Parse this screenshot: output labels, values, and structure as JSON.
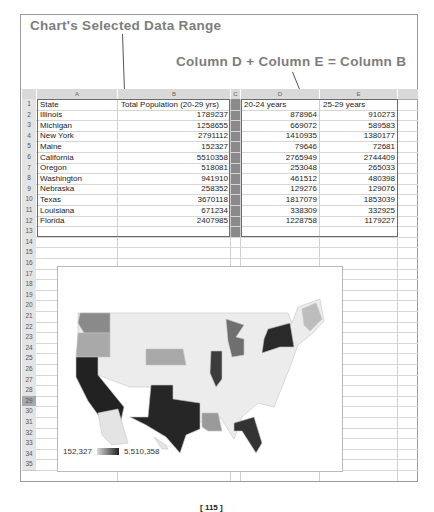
{
  "annotations": {
    "selected_range_label": "Chart's Selected Data Range",
    "formula_label": "Column D + Column E = Column B"
  },
  "spreadsheet": {
    "columns": [
      "A",
      "B",
      "C",
      "D",
      "E"
    ],
    "row_numbers": [
      "1",
      "2",
      "3",
      "4",
      "5",
      "6",
      "7",
      "8",
      "9",
      "10",
      "11",
      "12",
      "13",
      "14",
      "15",
      "16",
      "17",
      "18",
      "19",
      "20",
      "21",
      "22",
      "23",
      "24",
      "25",
      "26",
      "27",
      "28",
      "29",
      "30",
      "31",
      "32",
      "33",
      "34",
      "35"
    ],
    "selected_row": "29",
    "headers": {
      "state": "State",
      "total": "Total Population (20-29 yrs)",
      "age_20_24": "20-24 years",
      "age_25_29": "25-29 years"
    },
    "rows": [
      {
        "state": "Illinois",
        "total": "1789237",
        "age_20_24": "878964",
        "age_25_29": "910273"
      },
      {
        "state": "Michigan",
        "total": "1258655",
        "age_20_24": "669072",
        "age_25_29": "589583"
      },
      {
        "state": "New York",
        "total": "2791112",
        "age_20_24": "1410935",
        "age_25_29": "1380177"
      },
      {
        "state": "Maine",
        "total": "152327",
        "age_20_24": "79646",
        "age_25_29": "72681"
      },
      {
        "state": "California",
        "total": "5510358",
        "age_20_24": "2765949",
        "age_25_29": "2744409"
      },
      {
        "state": "Oregon",
        "total": "518081",
        "age_20_24": "253048",
        "age_25_29": "265033"
      },
      {
        "state": "Washington",
        "total": "941910",
        "age_20_24": "461512",
        "age_25_29": "480398"
      },
      {
        "state": "Nebraska",
        "total": "258352",
        "age_20_24": "129276",
        "age_25_29": "129076"
      },
      {
        "state": "Texas",
        "total": "3670118",
        "age_20_24": "1817079",
        "age_25_29": "1853039"
      },
      {
        "state": "Louisiana",
        "total": "671234",
        "age_20_24": "338309",
        "age_25_29": "332925"
      },
      {
        "state": "Florida",
        "total": "2407985",
        "age_20_24": "1228758",
        "age_25_29": "1179227"
      }
    ]
  },
  "chart": {
    "type": "geo-map",
    "region": "USA",
    "legend_min": "152,327",
    "legend_max": "5,510,358",
    "colors": {
      "low": "#d8d8d8",
      "high": "#222222",
      "empty": "#ececec"
    }
  },
  "page_number": "[ 115 ]"
}
